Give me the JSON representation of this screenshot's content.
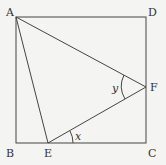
{
  "diagram": {
    "type": "geometry",
    "points": {
      "A": {
        "label": "A"
      },
      "B": {
        "label": "B"
      },
      "C": {
        "label": "C"
      },
      "D": {
        "label": "D"
      },
      "E": {
        "label": "E"
      },
      "F": {
        "label": "F"
      }
    },
    "segments": [
      "AB",
      "BC",
      "CD",
      "DA",
      "AE",
      "AF",
      "EF"
    ],
    "angles": [
      {
        "label": "y",
        "vertex": "F",
        "between": [
          "FA",
          "FE"
        ]
      },
      {
        "label": "x",
        "vertex": "E",
        "between": [
          "EC",
          "EF"
        ]
      }
    ]
  }
}
